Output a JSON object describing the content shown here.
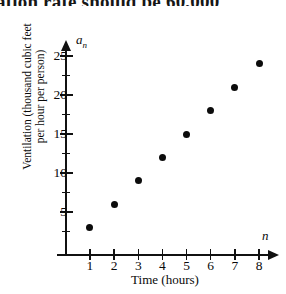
{
  "header": {
    "cutoff_text": "ation rate should be 60,000"
  },
  "axes": {
    "y_variable": "a",
    "y_variable_subscript": "n",
    "x_variable": "n",
    "y_title_line1": "Ventilation (thousand cubic feet",
    "y_title_line2": "per hour per person)",
    "x_title": "Time (hours)",
    "y_tick_labels": [
      "5",
      "10",
      "15",
      "20",
      "25"
    ],
    "x_tick_labels": [
      "1",
      "2",
      "3",
      "4",
      "5",
      "6",
      "7",
      "8"
    ]
  },
  "chart_data": {
    "type": "scatter",
    "title": "",
    "subtitle": "",
    "xlabel": "Time (hours)",
    "ylabel": "Ventilation (thousand cubic feet per hour per person)",
    "x_axis_variable": "n",
    "y_axis_variable": "a_n",
    "x": [
      1,
      2,
      3,
      4,
      5,
      6,
      7,
      8
    ],
    "values": [
      3,
      6,
      9,
      12,
      15,
      18,
      21,
      24
    ],
    "points": [
      {
        "x": 1,
        "y": 3
      },
      {
        "x": 2,
        "y": 6
      },
      {
        "x": 3,
        "y": 9
      },
      {
        "x": 4,
        "y": 12
      },
      {
        "x": 5,
        "y": 15
      },
      {
        "x": 6,
        "y": 18
      },
      {
        "x": 7,
        "y": 21
      },
      {
        "x": 8,
        "y": 24
      }
    ],
    "xlim": [
      0,
      8.7
    ],
    "ylim": [
      0,
      26
    ],
    "x_ticks": [
      1,
      2,
      3,
      4,
      5,
      6,
      7,
      8
    ],
    "y_ticks_major": [
      5,
      10,
      15,
      20,
      25
    ],
    "y_ticks_minor": [
      2.5,
      7.5,
      12.5,
      17.5,
      22.5
    ],
    "grid": false,
    "legend": null,
    "marker_color": "#0c0c0c",
    "axis_color": "#111111"
  }
}
